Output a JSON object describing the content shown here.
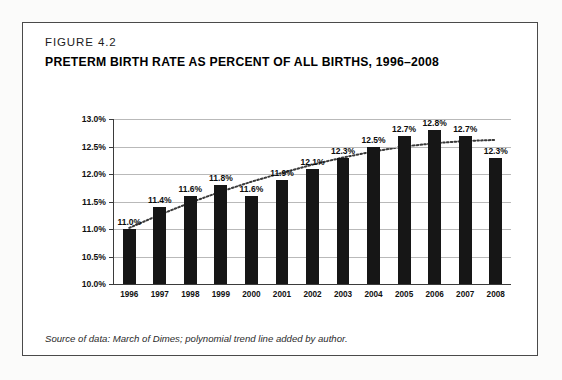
{
  "figure": {
    "number": "FIGURE 4.2",
    "title": "PRETERM BIRTH RATE AS PERCENT OF ALL BIRTHS, 1996–2008",
    "caption": "Source of data: March of Dimes; polynomial trend line added by author."
  },
  "colors": {
    "bar": "#161616",
    "grid": "#b9b9b9",
    "axis": "#3b3b3b",
    "trend": "#3a3a3a",
    "frame": "#4a4a4a",
    "page": "#ffffff"
  },
  "chart_data": {
    "type": "bar",
    "title": "PRETERM BIRTH RATE AS PERCENT OF ALL BIRTHS, 1996–2008",
    "subtitle": "FIGURE 4.2",
    "xlabel": "",
    "ylabel": "",
    "categories": [
      "1996",
      "1997",
      "1998",
      "1999",
      "2000",
      "2001",
      "2002",
      "2003",
      "2004",
      "2005",
      "2006",
      "2007",
      "2008"
    ],
    "values": [
      11.0,
      11.4,
      11.6,
      11.8,
      11.6,
      11.9,
      12.1,
      12.3,
      12.5,
      12.7,
      12.8,
      12.7,
      12.3
    ],
    "data_labels": [
      "11.0%",
      "11.4%",
      "11.6%",
      "11.8%",
      "11.6%",
      "11.9%",
      "12.1%",
      "12.3%",
      "12.5%",
      "12.7%",
      "12.8%",
      "12.7%",
      "12.3%"
    ],
    "ylim": [
      10.0,
      13.0
    ],
    "ytick_values": [
      10.0,
      10.5,
      11.0,
      11.5,
      12.0,
      12.5,
      13.0
    ],
    "ytick_labels": [
      "10.0%",
      "10.5%",
      "11.0%",
      "11.5%",
      "12.0%",
      "12.5%",
      "13.0%"
    ],
    "grid": true,
    "legend": false,
    "legend_position": "none",
    "annotations": [
      "polynomial trend line added by author"
    ],
    "series": [
      {
        "name": "Preterm birth rate",
        "type": "bar",
        "values": [
          11.0,
          11.4,
          11.6,
          11.8,
          11.6,
          11.9,
          12.1,
          12.3,
          12.5,
          12.7,
          12.8,
          12.7,
          12.3
        ]
      },
      {
        "name": "Polynomial trend line",
        "type": "line",
        "style": "dotted",
        "values": [
          11.02,
          11.26,
          11.48,
          11.68,
          11.86,
          12.02,
          12.17,
          12.3,
          12.41,
          12.5,
          12.56,
          12.6,
          12.62
        ]
      }
    ]
  }
}
